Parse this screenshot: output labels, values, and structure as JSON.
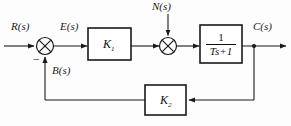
{
  "diagram": {
    "background_color": "#fdfdfd",
    "line_color": "#1a1a1a",
    "signals": {
      "input": "R(s)",
      "error": "E(s)",
      "disturbance": "N(s)",
      "output": "C(s)",
      "feedback": "B(s)"
    },
    "blocks": {
      "forward_gain": "K",
      "forward_gain_sub": "1",
      "feedback_gain": "K",
      "feedback_gain_sub": "2",
      "plant_numerator": "1",
      "plant_denominator": "Ts+1"
    },
    "summing_junctions": {
      "first_negative_sign": "−",
      "junction_symbol": "cross-in-circle"
    }
  }
}
